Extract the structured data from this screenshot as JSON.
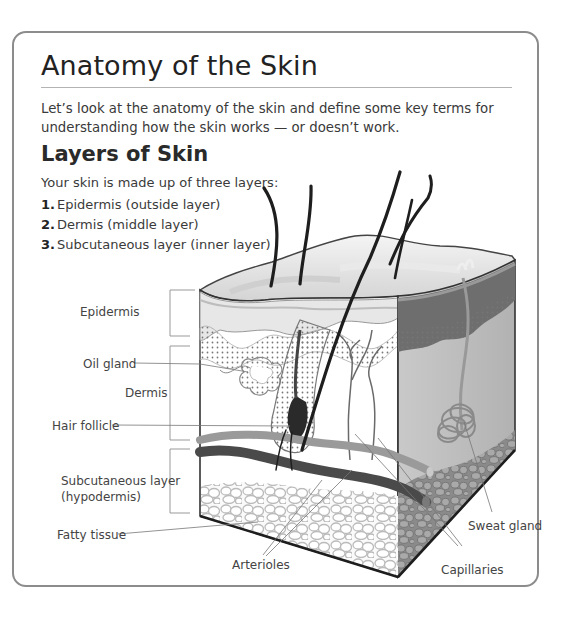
{
  "page": {
    "title": "Anatomy of the Skin",
    "intro": "Let’s look at the anatomy of the skin and define some key terms for understanding how the skin works — or doesn’t work.",
    "section": {
      "title": "Layers of Skin",
      "lead": "Your skin is made up of three layers:",
      "layers": [
        {
          "num": "1.",
          "text": "Epidermis (outside layer)"
        },
        {
          "num": "2.",
          "text": "Dermis (middle layer)"
        },
        {
          "num": "3.",
          "text": "Subcutaneous layer (inner layer)"
        }
      ]
    }
  },
  "diagram": {
    "labels": {
      "epidermis": "Epidermis",
      "oil_gland": "Oil gland",
      "dermis": "Dermis",
      "hair_follicle": "Hair follicle",
      "subcutaneous_1": "Subcutaneous layer",
      "subcutaneous_2": "(hypodermis)",
      "fatty_tissue": "Fatty tissue",
      "arterioles": "Arterioles",
      "capillaries": "Capillaries",
      "sweat_gland": "Sweat gland"
    },
    "colors": {
      "border": "#8c8c8c",
      "rule": "#b3b3b3",
      "leader": "#777777",
      "hair": "#1e1e1e",
      "epidermis_top": "#e6e6e6",
      "side_face": "#bdbdbd",
      "side_dark": "#6e6e6e",
      "vessel_dark": "#4a4a4a",
      "vessel_light": "#9a9a9a",
      "fat_cell": "#bbbbbb"
    }
  }
}
